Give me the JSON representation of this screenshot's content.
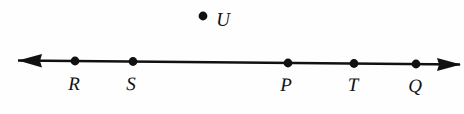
{
  "figure": {
    "background_color": "#fefefe",
    "stroke_color": "#111111",
    "width": 464,
    "height": 114
  },
  "line": {
    "name": "horizontal-number-line",
    "x1": 18,
    "y1": 60.5,
    "x2": 460,
    "y2": 64.5,
    "stroke_width": 2.6,
    "left_arrow": true,
    "right_arrow": true
  },
  "chart_data": {
    "type": "scatter",
    "title": "",
    "xlabel": "",
    "ylabel": "",
    "grid": false,
    "legend": null,
    "points": [
      {
        "label": "R",
        "x": 75,
        "y": 61,
        "on_line": true,
        "label_x": 74,
        "label_y": 90
      },
      {
        "label": "S",
        "x": 133,
        "y": 61.5,
        "on_line": true,
        "label_x": 131,
        "label_y": 90
      },
      {
        "label": "P",
        "x": 288,
        "y": 63,
        "on_line": true,
        "label_x": 286,
        "label_y": 91
      },
      {
        "label": "T",
        "x": 354,
        "y": 63.5,
        "on_line": true,
        "label_x": 353,
        "label_y": 91
      },
      {
        "label": "Q",
        "x": 416,
        "y": 64,
        "on_line": true,
        "label_x": 415,
        "label_y": 92
      },
      {
        "label": "U",
        "x": 203,
        "y": 16,
        "on_line": false,
        "label_x": 223,
        "label_y": 25
      }
    ],
    "point_radius": 4.4,
    "order_on_line": [
      "R",
      "S",
      "P",
      "T",
      "Q"
    ],
    "off_line_points": [
      "U"
    ],
    "xlim": [
      18,
      460
    ],
    "ylim": [
      0,
      114
    ]
  }
}
